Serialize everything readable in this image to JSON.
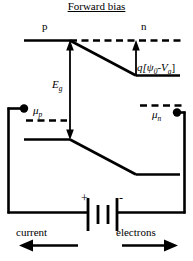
{
  "figure": {
    "title": "Forward bias",
    "background_color": "#ffffff",
    "line_color": "#000000",
    "width": 193,
    "height": 261
  },
  "band_diagram": {
    "region_labels": {
      "p_side": "p",
      "n_side": "n"
    },
    "energy_labels": {
      "band_gap": "E",
      "band_gap_sub": "g",
      "barrier_prefix": "q[",
      "barrier_psi": "ψ",
      "barrier_psi_sub": "0",
      "barrier_minus": "-",
      "barrier_v": "V",
      "barrier_v_sub": "a",
      "barrier_suffix": "]",
      "barrier_full": "q[ψ0-Va]"
    },
    "fermi_levels": {
      "p_side": "μ",
      "p_side_sub": "p",
      "n_side": "μ",
      "n_side_sub": "n"
    }
  },
  "circuit": {
    "battery": {
      "positive_terminal": "+",
      "negative_terminal": "-"
    },
    "flow_labels": {
      "current": "current",
      "current_direction": "left",
      "electrons": "electrons",
      "electrons_direction": "right"
    }
  }
}
